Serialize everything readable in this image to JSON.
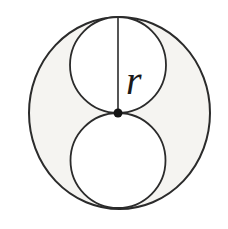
{
  "figure": {
    "label": "r",
    "colors": {
      "background": "#ffffff",
      "stroke": "#2b2b2b",
      "shaded_region": "#f5f4f1",
      "inner_fill": "#ffffff",
      "dot": "#141414",
      "label_color": "#1a1a1a"
    },
    "outer_circle": {
      "cx": 119.5,
      "cy": 113,
      "rx": 90.5,
      "ry": 96,
      "fill": "#f5f4f1",
      "stroke": "#2b2b2b",
      "stroke-width": 2
    },
    "top_inner_circle": {
      "cx": 118,
      "cy": 65,
      "r": 48,
      "fill": "#ffffff",
      "stroke": "#2b2b2b",
      "stroke-width": 1.8
    },
    "bottom_inner_circle": {
      "cx": 118,
      "cy": 160.5,
      "r": 47.5,
      "fill": "#ffffff",
      "stroke": "#2b2b2b",
      "stroke-width": 1.8
    },
    "radius_line": {
      "x1": 118,
      "y1": 17,
      "x2": 118,
      "y2": 113,
      "stroke": "#2b2b2b",
      "stroke-width": 1.6
    },
    "center_dot": {
      "cx": 118,
      "cy": 113,
      "r": 4.5,
      "fill": "#141414"
    },
    "label_pos": {
      "x": 126,
      "y": 94,
      "fill": "#1a1a1a"
    }
  }
}
